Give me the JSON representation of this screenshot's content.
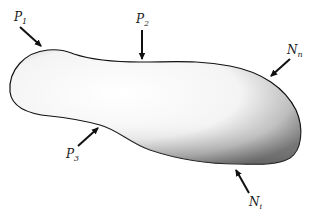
{
  "diagram": {
    "type": "free-body contact forces on a rigid body",
    "body": {
      "fill_light": "#ffffff",
      "fill_dark": "#5a5a5a",
      "outline": "#111111"
    },
    "forces": [
      {
        "id": "P1",
        "symbol": "P",
        "subscript": "1",
        "direction": "down-right, pushing onto upper-left surface"
      },
      {
        "id": "P2",
        "symbol": "P",
        "subscript": "2",
        "direction": "straight down onto top surface"
      },
      {
        "id": "P3",
        "symbol": "P",
        "subscript": "3",
        "direction": "up-right onto lower-left surface"
      },
      {
        "id": "Nn",
        "symbol": "N",
        "subscript": "n",
        "direction": "down-left onto upper-right surface"
      },
      {
        "id": "Ni",
        "symbol": "N",
        "subscript": "i",
        "direction": "up-left onto bottom-right surface"
      }
    ]
  }
}
